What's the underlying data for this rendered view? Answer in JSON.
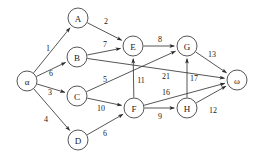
{
  "diagram": {
    "colors": {
      "stroke": "#2b2b2b",
      "background": "#ffffff",
      "text": "#1a1a1a"
    },
    "nodes": [
      {
        "id": "alpha",
        "label": "α",
        "x": 27,
        "y": 81,
        "r": 10
      },
      {
        "id": "A",
        "label": "A",
        "x": 78,
        "y": 18,
        "r": 10
      },
      {
        "id": "B",
        "label": "B",
        "x": 77,
        "y": 57,
        "r": 10
      },
      {
        "id": "C",
        "label": "C",
        "x": 77,
        "y": 96,
        "r": 10
      },
      {
        "id": "D",
        "label": "D",
        "x": 78,
        "y": 140,
        "r": 10
      },
      {
        "id": "E",
        "label": "E",
        "x": 133,
        "y": 46,
        "r": 10
      },
      {
        "id": "F",
        "label": "F",
        "x": 134,
        "y": 108,
        "r": 10
      },
      {
        "id": "G",
        "label": "G",
        "x": 187,
        "y": 46,
        "r": 10
      },
      {
        "id": "H",
        "label": "H",
        "x": 187,
        "y": 108,
        "r": 10
      },
      {
        "id": "omega",
        "label": "ω",
        "x": 237,
        "y": 80,
        "r": 10
      }
    ],
    "edges": [
      {
        "id": "alpha-A",
        "from": "alpha",
        "to": "A",
        "weight": "1",
        "lx": 48,
        "ly": 48
      },
      {
        "id": "alpha-B",
        "from": "alpha",
        "to": "B",
        "weight": "6",
        "lx": 51,
        "ly": 73
      },
      {
        "id": "alpha-C",
        "from": "alpha",
        "to": "C",
        "weight": "3",
        "lx": 50,
        "ly": 92
      },
      {
        "id": "alpha-D",
        "from": "alpha",
        "to": "D",
        "weight": "4",
        "lx": 46,
        "ly": 119
      },
      {
        "id": "A-E",
        "from": "A",
        "to": "E",
        "weight": "2",
        "lx": 106,
        "ly": 21
      },
      {
        "id": "B-E",
        "from": "B",
        "to": "E",
        "weight": "7",
        "lx": 105,
        "ly": 44
      },
      {
        "id": "B-omega",
        "from": "B",
        "to": "omega",
        "weight": "21",
        "lx": 166,
        "ly": 76
      },
      {
        "id": "C-G",
        "from": "C",
        "to": "G",
        "weight": "5",
        "lx": 105,
        "ly": 79
      },
      {
        "id": "C-F",
        "from": "C",
        "to": "F",
        "weight": "10",
        "lx": 101,
        "ly": 108
      },
      {
        "id": "D-F",
        "from": "D",
        "to": "F",
        "weight": "6",
        "lx": 105,
        "ly": 133
      },
      {
        "id": "E-G",
        "from": "E",
        "to": "G",
        "weight": "8",
        "lx": 160,
        "ly": 39
      },
      {
        "id": "F-E",
        "from": "F",
        "to": "E",
        "weight": "11",
        "lx": 141,
        "ly": 80
      },
      {
        "id": "F-H",
        "from": "F",
        "to": "H",
        "weight": "9",
        "lx": 160,
        "ly": 116
      },
      {
        "id": "F-omega",
        "from": "F",
        "to": "omega",
        "weight": "16",
        "lx": 166,
        "ly": 92
      },
      {
        "id": "G-omega",
        "from": "G",
        "to": "omega",
        "weight": "13",
        "lx": 212,
        "ly": 54
      },
      {
        "id": "H-G",
        "from": "H",
        "to": "G",
        "weight": "17",
        "lx": 194,
        "ly": 78
      },
      {
        "id": "H-omega",
        "from": "H",
        "to": "omega",
        "weight": "12",
        "lx": 213,
        "ly": 110
      }
    ]
  }
}
